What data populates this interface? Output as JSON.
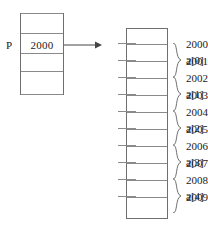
{
  "diagram": {
    "colors": {
      "stroke": "#6f6f6f",
      "gridline": "#8a8a8a",
      "text": "#1a1a1a",
      "background": "#ffffff"
    }
  },
  "pointer": {
    "label": "P",
    "value": "2000",
    "rows": 5
  },
  "arrow": {
    "name": "points-to-arrow",
    "from": "pointer-value-cell",
    "to": "memory-address-2000"
  },
  "memory": {
    "addresses": [
      "2000",
      "2001",
      "2002",
      "2003",
      "2004",
      "2005",
      "2006",
      "2007",
      "2008",
      "2009"
    ],
    "cell_count": 12
  },
  "elements": [
    {
      "label": "a[0]",
      "addresses": [
        "2000",
        "2001"
      ]
    },
    {
      "label": "a[1]",
      "addresses": [
        "2002",
        "2003"
      ]
    },
    {
      "label": "a[2]",
      "addresses": [
        "2004",
        "2005"
      ]
    },
    {
      "label": "a[3]",
      "addresses": [
        "2006",
        "2007"
      ]
    },
    {
      "label": "a[4]",
      "addresses": [
        "2008",
        "2009"
      ]
    }
  ]
}
